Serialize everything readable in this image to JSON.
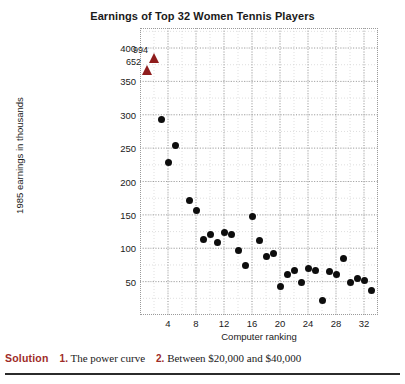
{
  "chart_data": {
    "type": "scatter",
    "title": "Earnings of Top 32 Women Tennis Players",
    "xlabel": "Computer ranking",
    "ylabel": "1985 earnings in thousands",
    "xlim": [
      0,
      34
    ],
    "ylim": [
      0,
      430
    ],
    "xticks": [
      4,
      8,
      12,
      16,
      20,
      24,
      28,
      32
    ],
    "yticks": [
      50,
      100,
      150,
      200,
      250,
      300,
      350,
      400
    ],
    "grid": true,
    "legend": "none",
    "point_color": "#0d0d0d",
    "offscale_color": "#8f1d1d",
    "x": [
      3,
      4,
      5,
      7,
      8,
      9,
      10,
      11,
      12,
      13,
      14,
      15,
      16,
      17,
      18,
      19,
      20,
      21,
      22,
      23,
      24,
      25,
      26,
      27,
      28,
      29,
      30,
      31,
      32,
      33
    ],
    "y": [
      293,
      229,
      254,
      172,
      157,
      113,
      121,
      108,
      124,
      120,
      97,
      74,
      148,
      111,
      88,
      92,
      43,
      61,
      67,
      49,
      70,
      66,
      22,
      65,
      61,
      85,
      49,
      54,
      52,
      36
    ],
    "points": [
      {
        "x": 3,
        "y": 293
      },
      {
        "x": 4,
        "y": 229
      },
      {
        "x": 5,
        "y": 254
      },
      {
        "x": 7,
        "y": 172
      },
      {
        "x": 8,
        "y": 157
      },
      {
        "x": 9,
        "y": 113
      },
      {
        "x": 10,
        "y": 121
      },
      {
        "x": 11,
        "y": 108
      },
      {
        "x": 12,
        "y": 124
      },
      {
        "x": 13,
        "y": 120
      },
      {
        "x": 14,
        "y": 97
      },
      {
        "x": 15,
        "y": 74
      },
      {
        "x": 16,
        "y": 148
      },
      {
        "x": 17,
        "y": 111
      },
      {
        "x": 18,
        "y": 88
      },
      {
        "x": 19,
        "y": 92
      },
      {
        "x": 20,
        "y": 43
      },
      {
        "x": 21,
        "y": 61
      },
      {
        "x": 22,
        "y": 67
      },
      {
        "x": 23,
        "y": 49
      },
      {
        "x": 24,
        "y": 70
      },
      {
        "x": 25,
        "y": 66
      },
      {
        "x": 26,
        "y": 22
      },
      {
        "x": 27,
        "y": 65
      },
      {
        "x": 28,
        "y": 61
      },
      {
        "x": 29,
        "y": 85
      },
      {
        "x": 30,
        "y": 49
      },
      {
        "x": 31,
        "y": 54
      },
      {
        "x": 32,
        "y": 52
      },
      {
        "x": 33,
        "y": 36
      }
    ],
    "offscale_points": [
      {
        "x": 1,
        "y": 652,
        "label": "652"
      },
      {
        "x": 2,
        "y": 994,
        "label": "994"
      }
    ],
    "annotations": [
      "994",
      "652"
    ]
  },
  "footer": {
    "solution_label": "Solution",
    "item1_num": "1.",
    "item1_text": "The power curve",
    "item2_num": "2.",
    "item2_text": "Between $20,000 and $40,000"
  }
}
